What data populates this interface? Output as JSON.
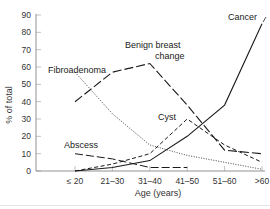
{
  "chart_data": {
    "type": "line",
    "title": "",
    "xlabel": "Age (years)",
    "ylabel": "% of total",
    "categories": [
      "≤ 20",
      "21–30",
      "31–40",
      "41–50",
      "51–60",
      ">60"
    ],
    "ylim": [
      0,
      90
    ],
    "yticks": [
      0,
      10,
      20,
      30,
      40,
      50,
      60,
      70,
      80,
      90
    ],
    "grid": false,
    "legend": "inline annotations",
    "series": [
      {
        "name": "Cancer",
        "style": "solid",
        "values": [
          0,
          2,
          6,
          20,
          38,
          85
        ]
      },
      {
        "name": "Benign breast change",
        "style": "long-dash",
        "values": [
          40,
          57,
          62,
          38,
          12,
          10
        ]
      },
      {
        "name": "Fibroadenoma",
        "style": "dotted",
        "values": [
          57,
          33,
          15,
          9,
          5,
          1
        ]
      },
      {
        "name": "Cyst",
        "style": "short-dash",
        "values": [
          0,
          4,
          10,
          30,
          15,
          5
        ]
      },
      {
        "name": "Abscess",
        "style": "dash",
        "values": [
          10,
          7,
          2,
          2,
          null,
          null
        ]
      }
    ],
    "annotations": {
      "cancer": "Cancer",
      "benign_line1": "Benign breast",
      "benign_line2": "change",
      "fibroadenoma": "Fibroadenoma",
      "cyst": "Cyst",
      "abscess": "Abscess"
    }
  }
}
